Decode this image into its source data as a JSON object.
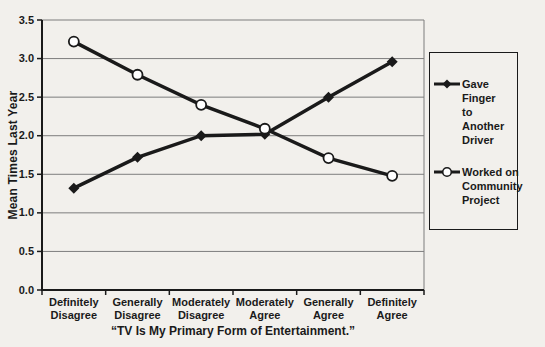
{
  "figure": {
    "background": "#f2f0ec",
    "line_color": "#1a1a1a",
    "gridline_color": "#7d7d7d"
  },
  "chart_data": {
    "type": "line",
    "categories": [
      "Definitely Disagree",
      "Generally Disagree",
      "Moderately Disagree",
      "Moderately Agree",
      "Generally Agree",
      "Definitely Agree"
    ],
    "series": [
      {
        "name": "Gave Finger to Another Driver",
        "legend_lines": [
          "Gave Finger",
          "to Another",
          "Driver"
        ],
        "marker": "filled-diamond",
        "color": "#1a1a1a",
        "values": [
          1.32,
          1.72,
          2.0,
          2.02,
          2.5,
          2.96
        ]
      },
      {
        "name": "Worked on Community Project",
        "legend_lines": [
          "Worked on",
          "Community",
          "Project"
        ],
        "marker": "open-circle",
        "color": "#1a1a1a",
        "values": [
          3.22,
          2.79,
          2.4,
          2.09,
          1.71,
          1.48
        ]
      }
    ],
    "title": "",
    "xlabel": "“TV Is My Primary Form of Entertainment.”",
    "ylabel": "Mean Times Last Year",
    "ylim": [
      0,
      3.5
    ],
    "ytick_step": 0.5,
    "grid": "horizontal",
    "legend_position": "right"
  }
}
